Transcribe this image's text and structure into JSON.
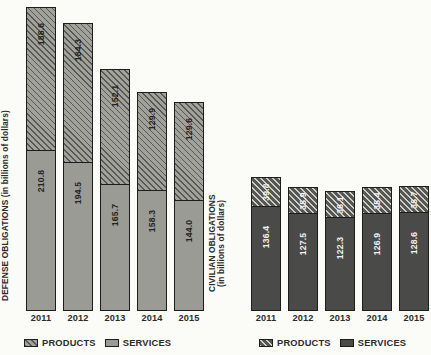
{
  "charts": {
    "defense": {
      "axis_label": "DEFENSE OBLIGATIONS (in billions of dollars)",
      "legend": {
        "products": "PRODUCTS",
        "services": "SERVICES"
      },
      "years": [
        "2011",
        "2012",
        "2013",
        "2014",
        "2015"
      ],
      "products": [
        "188.6",
        "184.3",
        "152.1",
        "129.9",
        "129.6"
      ],
      "services": [
        "210.8",
        "194.5",
        "165.7",
        "158.3",
        "144.0"
      ]
    },
    "civilian": {
      "axis_label_line1": "CIVILIAN OBLIGATIONS",
      "axis_label_line2": "(in billions of dollars)",
      "legend": {
        "products": "PRODUCTS",
        "services": "SERVICES"
      },
      "years": [
        "2011",
        "2012",
        "2013",
        "2014",
        "2015"
      ],
      "products": [
        "39.8",
        "35.9",
        "36.1",
        "35.4",
        "35.7"
      ],
      "services": [
        "136.4",
        "127.5",
        "122.3",
        "126.9",
        "128.6"
      ]
    }
  },
  "colors": {
    "background": "#fbfbf8",
    "defense_products_fill": "#a2a29c",
    "defense_services_fill": "#9b9b96",
    "civilian_products_fill": "#565653",
    "civilian_services_fill": "#4a4a49",
    "outline": "#1d1d1d"
  },
  "chart_data": [
    {
      "type": "bar",
      "subtype": "stacked-vertical",
      "title": "",
      "xlabel": "",
      "ylabel": "DEFENSE OBLIGATIONS (in billions of dollars)",
      "categories": [
        "2011",
        "2012",
        "2013",
        "2014",
        "2015"
      ],
      "series": [
        {
          "name": "SERVICES",
          "values": [
            210.8,
            194.5,
            165.7,
            158.3,
            144.0
          ]
        },
        {
          "name": "PRODUCTS",
          "values": [
            188.6,
            184.3,
            152.1,
            129.9,
            129.6
          ]
        }
      ],
      "totals": [
        399.4,
        378.8,
        317.8,
        288.2,
        273.6
      ],
      "stack_order_bottom_to_top": [
        "SERVICES",
        "PRODUCTS"
      ],
      "ylim": [
        0,
        399.4
      ],
      "grid": false,
      "legend_position": "bottom",
      "data_labels": true
    },
    {
      "type": "bar",
      "subtype": "stacked-vertical",
      "title": "",
      "xlabel": "",
      "ylabel": "CIVILIAN OBLIGATIONS (in billions of dollars)",
      "categories": [
        "2011",
        "2012",
        "2013",
        "2014",
        "2015"
      ],
      "series": [
        {
          "name": "SERVICES",
          "values": [
            136.4,
            127.5,
            122.3,
            126.9,
            128.6
          ]
        },
        {
          "name": "PRODUCTS",
          "values": [
            39.8,
            35.9,
            36.1,
            35.4,
            35.7
          ]
        }
      ],
      "totals": [
        176.2,
        163.4,
        158.4,
        162.3,
        164.3
      ],
      "stack_order_bottom_to_top": [
        "SERVICES",
        "PRODUCTS"
      ],
      "ylim": [
        0,
        399.4
      ],
      "grid": false,
      "legend_position": "bottom",
      "data_labels": true
    }
  ]
}
